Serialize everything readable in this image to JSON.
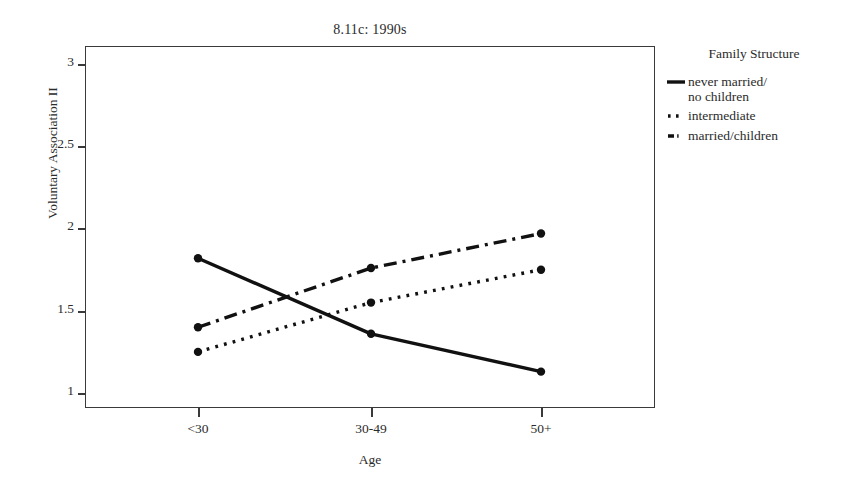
{
  "chart_data": {
    "type": "line",
    "title": "8.11c: 1990s",
    "xlabel": "Age",
    "ylabel": "Voluntary Association II",
    "categories": [
      "<30",
      "30-49",
      "50+"
    ],
    "ylim": [
      0.8,
      3.2
    ],
    "yticks": [
      1,
      1.5,
      2,
      2.5,
      3
    ],
    "ytick_labels": [
      "1",
      "1.5",
      "2",
      "2.5",
      "3"
    ],
    "grid": false,
    "legend_position": "right",
    "legend_title": "Family Structure",
    "series": [
      {
        "name": "never married/\nno children",
        "label_line1": "never married/",
        "label_line2": "no children",
        "style": "solid",
        "color": "#111111",
        "values": [
          1.82,
          1.36,
          1.13
        ]
      },
      {
        "name": "intermediate",
        "label_line1": "intermediate",
        "label_line2": "",
        "style": "dotted",
        "color": "#111111",
        "values": [
          1.25,
          1.55,
          1.75
        ]
      },
      {
        "name": "married/children",
        "label_line1": "married/children",
        "label_line2": "",
        "style": "dash-dot",
        "color": "#111111",
        "values": [
          1.4,
          1.76,
          1.97
        ]
      }
    ]
  },
  "axes": {
    "ytick_0": "1",
    "ytick_1": "1.5",
    "ytick_2": "2",
    "ytick_3": "2.5",
    "ytick_4": "3",
    "xtick_0": "<30",
    "xtick_1": "30-49",
    "xtick_2": "50+"
  },
  "colors": {
    "frame": "#3a3a3a",
    "ink": "#111111",
    "text": "#2b2b2b",
    "background": "#ffffff"
  }
}
